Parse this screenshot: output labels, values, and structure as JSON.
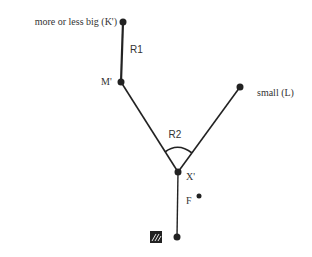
{
  "diagram": {
    "nodes": {
      "k": {
        "label": "more or less big (K')",
        "x": 123,
        "y": 22
      },
      "m": {
        "label": "M'",
        "x": 121,
        "y": 82
      },
      "l": {
        "label": "small (L)",
        "x": 240,
        "y": 87
      },
      "x": {
        "label": "X'",
        "x": 178,
        "y": 172
      },
      "f": {
        "label": "F",
        "x": 199,
        "y": 196
      },
      "bottom": {
        "label": "",
        "x": 177,
        "y": 237
      }
    },
    "edges": {
      "r1": {
        "label": "R1"
      },
      "r2": {
        "label": "R2"
      }
    },
    "icon": {
      "name": "hatched-square-icon"
    },
    "colors": {
      "line": "#222222",
      "text": "#333333"
    }
  }
}
